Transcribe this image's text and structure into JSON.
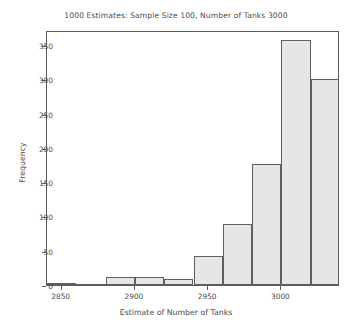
{
  "chart_data": {
    "type": "bar",
    "title": "1000 Estimates: Sample Size 100, Number of Tanks 3000",
    "xlabel": "Estimate of Number of Tanks",
    "ylabel": "Frequency",
    "xlim": [
      2840,
      3040
    ],
    "ylim": [
      0,
      372
    ],
    "grid": false,
    "legend": null,
    "bin_width": 20,
    "bin_edges": [
      2840,
      2860,
      2880,
      2900,
      2920,
      2940,
      2960,
      2980,
      3000,
      3020,
      3040
    ],
    "categories": [
      "2840-2860",
      "2860-2880",
      "2880-2900",
      "2900-2920",
      "2920-2940",
      "2940-2960",
      "2960-2980",
      "2980-3000",
      "3000-3020",
      "3020-3040"
    ],
    "values": [
      2,
      0,
      11,
      11,
      9,
      43,
      89,
      176,
      357,
      301
    ],
    "xticks": [
      2850,
      2900,
      2950,
      3000
    ],
    "xtick_labels": [
      "2850",
      "2900",
      "2950",
      "3000"
    ],
    "yticks": [
      0,
      50,
      100,
      150,
      200,
      250,
      300,
      350
    ],
    "ytick_labels": [
      "0",
      "50",
      "100",
      "150",
      "200",
      "250",
      "300",
      "350"
    ],
    "bar_fill_color": "#e6e6e6",
    "bar_edge_color": "#5f5f5f",
    "axes_color": "#5a5a5a",
    "text_color": "#4d4d4d",
    "background_color": "#ffffff"
  }
}
